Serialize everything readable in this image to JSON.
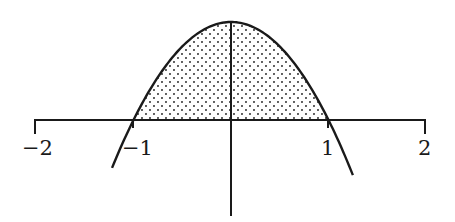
{
  "chart_data": {
    "type": "line",
    "title": "",
    "xlabel": "",
    "ylabel": "",
    "function": "y = 1 - x^2",
    "x_range_plotted": [
      -1.22,
      1.25
    ],
    "xlim": [
      -2,
      2
    ],
    "x_ticks": [
      -2,
      -1,
      1,
      2
    ],
    "x_tick_labels": [
      "−2",
      "−1",
      "1",
      "2"
    ],
    "grid": false,
    "legend": null,
    "shaded_region": {
      "description": "area between curve and x-axis",
      "x_from": -1,
      "x_to": 1,
      "pattern": "dots"
    },
    "key_points": [
      {
        "x": -1,
        "y": 0,
        "label": "left root"
      },
      {
        "x": 0,
        "y": 1,
        "label": "vertex"
      },
      {
        "x": 1,
        "y": 0,
        "label": "right root"
      }
    ]
  },
  "labels": {
    "tick_neg2": "−2",
    "tick_neg1": "−1",
    "tick_pos1": "1",
    "tick_pos2": "2"
  },
  "colors": {
    "ink": "#1a1a1a",
    "background": "#ffffff",
    "dots": "#3a3a3a"
  }
}
